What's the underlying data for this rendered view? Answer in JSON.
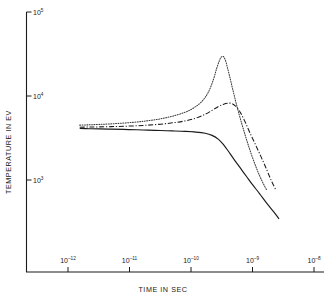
{
  "chart_data": {
    "type": "line",
    "title": "",
    "xlabel": "TIME IN SEC",
    "ylabel": "TEMPERATURE IN EV",
    "xscale": "log",
    "yscale": "log",
    "xlim": [
      1e-12,
      1e-08
    ],
    "ylim": [
      700,
      100000
    ],
    "grid": false,
    "legend": "none",
    "xticks": [
      {
        "value": 1e-12,
        "mantissa": "10",
        "exponent": "–12"
      },
      {
        "value": 1e-11,
        "mantissa": "10",
        "exponent": "–11"
      },
      {
        "value": 1e-10,
        "mantissa": "10",
        "exponent": "–10"
      },
      {
        "value": 1e-09,
        "mantissa": "10",
        "exponent": "–9"
      },
      {
        "value": 1e-08,
        "mantissa": "10",
        "exponent": "–8"
      }
    ],
    "yticks": [
      {
        "value": 100000,
        "mantissa": "10",
        "exponent": "5"
      },
      {
        "value": 10000,
        "mantissa": "10",
        "exponent": "4"
      },
      {
        "value": 1000,
        "mantissa": "10",
        "exponent": "3"
      }
    ],
    "series": [
      {
        "name": "solid-curve",
        "style": "solid",
        "color": "#1a1a1a",
        "points": [
          [
            1.55e-12,
            4100
          ],
          [
            2.2e-12,
            4080
          ],
          [
            3.2e-12,
            4060
          ],
          [
            5e-12,
            4030
          ],
          [
            8e-12,
            4000
          ],
          [
            1.3e-11,
            3960
          ],
          [
            2e-11,
            3920
          ],
          [
            3.2e-11,
            3880
          ],
          [
            5e-11,
            3840
          ],
          [
            8e-11,
            3790
          ],
          [
            1.2e-10,
            3720
          ],
          [
            1.7e-10,
            3600
          ],
          [
            2.2e-10,
            3400
          ],
          [
            2.8e-10,
            3050
          ],
          [
            3.4e-10,
            2620
          ],
          [
            4e-10,
            2230
          ],
          [
            5e-10,
            1760
          ],
          [
            6.2e-10,
            1420
          ],
          [
            8e-10,
            1100
          ],
          [
            1e-09,
            880
          ],
          [
            1.3e-09,
            690
          ],
          [
            1.7e-09,
            530
          ],
          [
            2.2e-09,
            420
          ],
          [
            2.7e-09,
            345
          ]
        ]
      },
      {
        "name": "dash-dot-curve",
        "style": "dashdot",
        "color": "#1a1a1a",
        "points": [
          [
            1.55e-12,
            4250
          ],
          [
            2.2e-12,
            4270
          ],
          [
            3.2e-12,
            4290
          ],
          [
            5e-12,
            4320
          ],
          [
            8e-12,
            4360
          ],
          [
            1.3e-11,
            4420
          ],
          [
            2e-11,
            4500
          ],
          [
            3.2e-11,
            4620
          ],
          [
            5e-11,
            4790
          ],
          [
            8e-11,
            5050
          ],
          [
            1.2e-10,
            5450
          ],
          [
            1.7e-10,
            6050
          ],
          [
            2.2e-10,
            6750
          ],
          [
            2.8e-10,
            7500
          ],
          [
            3.4e-10,
            8000
          ],
          [
            4e-10,
            8200
          ],
          [
            4.6e-10,
            8150
          ],
          [
            5.4e-10,
            7500
          ],
          [
            6.4e-10,
            6300
          ],
          [
            7.6e-10,
            4900
          ],
          [
            9e-10,
            3700
          ],
          [
            1.1e-09,
            2700
          ],
          [
            1.35e-09,
            1950
          ],
          [
            1.65e-09,
            1400
          ],
          [
            2e-09,
            1000
          ],
          [
            2.4e-09,
            760
          ]
        ]
      },
      {
        "name": "dotted-curve",
        "style": "dotted",
        "color": "#3a3a3a",
        "points": [
          [
            1.55e-12,
            4500
          ],
          [
            2.2e-12,
            4540
          ],
          [
            3.2e-12,
            4590
          ],
          [
            5e-12,
            4660
          ],
          [
            8e-12,
            4760
          ],
          [
            1.3e-11,
            4900
          ],
          [
            2e-11,
            5080
          ],
          [
            3.2e-11,
            5350
          ],
          [
            5e-11,
            5750
          ],
          [
            8e-11,
            6400
          ],
          [
            1.1e-10,
            7200
          ],
          [
            1.5e-10,
            8600
          ],
          [
            1.9e-10,
            11000
          ],
          [
            2.3e-10,
            15500
          ],
          [
            2.6e-10,
            21000
          ],
          [
            2.9e-10,
            26500
          ],
          [
            3.1e-10,
            29000
          ],
          [
            3.35e-10,
            29500
          ],
          [
            3.6e-10,
            27000
          ],
          [
            3.9e-10,
            22000
          ],
          [
            4.3e-10,
            16500
          ],
          [
            4.8e-10,
            11800
          ],
          [
            5.4e-10,
            8300
          ],
          [
            6.2e-10,
            5700
          ],
          [
            7.2e-10,
            3900
          ],
          [
            8.4e-10,
            2700
          ],
          [
            1e-09,
            1850
          ],
          [
            1.2e-09,
            1300
          ],
          [
            1.45e-09,
            950
          ],
          [
            1.7e-09,
            760
          ]
        ]
      }
    ]
  },
  "figure": {
    "xlabel": "TIME IN SEC",
    "ylabel": "TEMPERATURE IN EV"
  }
}
